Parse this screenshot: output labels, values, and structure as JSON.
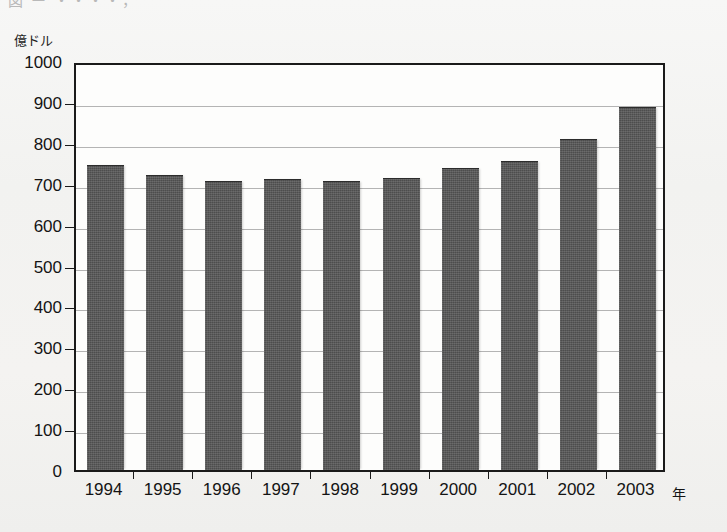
{
  "figure": {
    "unit_label": "億ドル",
    "x_axis_name": "年",
    "caption_fragment": "図  ー    ・・・・，"
  },
  "chart_data": {
    "type": "bar",
    "title": "",
    "xlabel": "年",
    "ylabel": "億ドル",
    "ylim": [
      0,
      1000
    ],
    "ytick_step": 100,
    "grid": true,
    "legend": "none",
    "bar_color": "#4d4d4d",
    "categories": [
      "1994",
      "1995",
      "1996",
      "1997",
      "1998",
      "1999",
      "2000",
      "2001",
      "2002",
      "2003"
    ],
    "values": [
      743,
      718,
      703,
      710,
      705,
      711,
      737,
      753,
      808,
      886
    ],
    "yticks": [
      "0",
      "100",
      "200",
      "300",
      "400",
      "500",
      "600",
      "700",
      "800",
      "900",
      "1000"
    ]
  }
}
